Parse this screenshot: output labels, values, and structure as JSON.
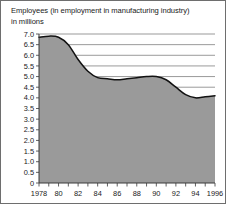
{
  "figure": {
    "title_line1": "Employees (in employment in manufacturing industry)",
    "title_line2": "in millions",
    "border_color": "#6e6e6e",
    "background": "#ffffff"
  },
  "chart_data": {
    "type": "area",
    "title": "Employees (in employment in manufacturing industry) in millions",
    "xlabel": "",
    "ylabel": "in millions",
    "ylim": [
      0,
      7.0
    ],
    "xlim": [
      1978,
      1996
    ],
    "grid": true,
    "legend": "none",
    "fill_color": "#9a9a9a",
    "line_color": "#121212",
    "y_ticks": [
      "0",
      "0.5",
      "1.0",
      "1.5",
      "2.0",
      "2.5",
      "3.0",
      "3.5",
      "4.0",
      "4.5",
      "5.0",
      "5.5",
      "6.0",
      "6.5",
      "7.0"
    ],
    "y_tick_values": [
      0,
      0.5,
      1.0,
      1.5,
      2.0,
      2.5,
      3.0,
      3.5,
      4.0,
      4.5,
      5.0,
      5.5,
      6.0,
      6.5,
      7.0
    ],
    "x_tick_labels": [
      "1978",
      "",
      "80",
      "",
      "82",
      "",
      "84",
      "",
      "86",
      "",
      "88",
      "",
      "90",
      "",
      "92",
      "",
      "94",
      "",
      "1996"
    ],
    "x": [
      1978,
      1979,
      1980,
      1981,
      1982,
      1983,
      1984,
      1985,
      1986,
      1987,
      1988,
      1989,
      1990,
      1991,
      1992,
      1993,
      1994,
      1995,
      1996
    ],
    "values": [
      6.85,
      6.9,
      6.85,
      6.5,
      5.8,
      5.25,
      4.95,
      4.9,
      4.85,
      4.9,
      4.95,
      5.0,
      5.0,
      4.85,
      4.5,
      4.15,
      4.0,
      4.05,
      4.1
    ]
  }
}
